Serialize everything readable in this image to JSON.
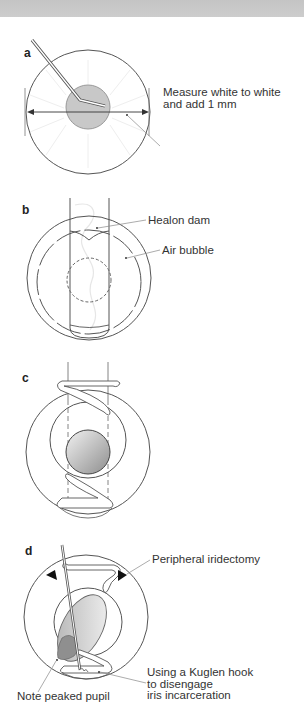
{
  "header": {
    "bar_color": "#c8c8c8"
  },
  "panels": [
    {
      "id": "a",
      "label": "a",
      "annotations": [
        {
          "lines": [
            "Measure white to white",
            "and add 1 mm"
          ]
        }
      ]
    },
    {
      "id": "b",
      "label": "b",
      "annotations": [
        {
          "lines": [
            "Healon dam"
          ]
        },
        {
          "lines": [
            "Air bubble"
          ]
        }
      ]
    },
    {
      "id": "c",
      "label": "c",
      "annotations": []
    },
    {
      "id": "d",
      "label": "d",
      "annotations": [
        {
          "lines": [
            "Peripheral iridectomy"
          ]
        },
        {
          "lines": [
            "Using a Kuglen hook",
            "to disengage",
            "iris incarceration"
          ]
        },
        {
          "lines": [
            "Note peaked pupil"
          ]
        }
      ]
    }
  ],
  "colors": {
    "line": "#444444",
    "pupil_fill": "#bdbdbd",
    "pupil_edge": "#888888",
    "iris_dark": "#9a9a9a"
  }
}
